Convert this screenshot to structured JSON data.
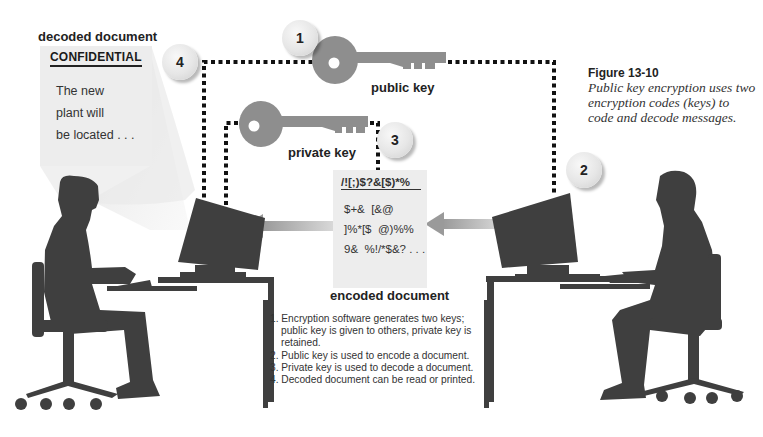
{
  "figure": {
    "number": "Figure 13-10",
    "caption": "Public key encryption uses two encryption codes (keys) to code and decode messages."
  },
  "labels": {
    "decoded_document": "decoded document",
    "public_key": "public key",
    "private_key": "private key",
    "encoded_document": "encoded document"
  },
  "badges": [
    "1",
    "2",
    "3",
    "4"
  ],
  "decoded_doc": {
    "title": "CONFIDENTIAL",
    "lines": [
      "The new",
      "plant will",
      "be located . . ."
    ]
  },
  "encoded_doc": {
    "title": "/![;)$?&[$)*%",
    "lines": [
      "$+&  [&@",
      "]%*[$  @)%%",
      "9&  %!/*$&? . . ."
    ]
  },
  "steps": [
    "1. Encryption software generates two keys; public key is given to others, private key is retained.",
    "2. Public key is used to encode a document.",
    "3. Private key is used to decode a document.",
    "4. Decoded document can be read or printed."
  ],
  "colors": {
    "silhouette": "#3f3f3f",
    "key": "#8e8e8e",
    "arrow": "#b5b5b5",
    "doc_bg": "#ededed",
    "dotted_line": "#111111"
  }
}
